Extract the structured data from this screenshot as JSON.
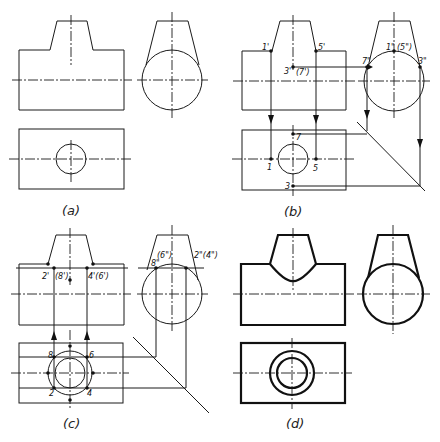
{
  "figure": {
    "panels": [
      {
        "id": "a",
        "caption": "(a)"
      },
      {
        "id": "b",
        "caption": "(b)",
        "labels": {
          "p1f": "1'",
          "p5f": "5'",
          "p3f": "3'",
          "p7f": "(7')",
          "p1s": "1\"",
          "p5s": "(5\")",
          "p7s": "7\"",
          "p3s": "3\"",
          "p1t": "1",
          "p5t": "5",
          "p7t": "7",
          "p3t": "3"
        }
      },
      {
        "id": "c",
        "caption": "(c)",
        "labels": {
          "p2f": "2'",
          "p8f": "(8')",
          "p4f": "4'(6')",
          "p6s": "(6\")",
          "p8s": "8\"",
          "p2s": "2\"(4\")",
          "p8t": "8",
          "p6t": "6",
          "p2t": "2",
          "p4t": "4"
        }
      },
      {
        "id": "d",
        "caption": "(d)"
      }
    ]
  }
}
